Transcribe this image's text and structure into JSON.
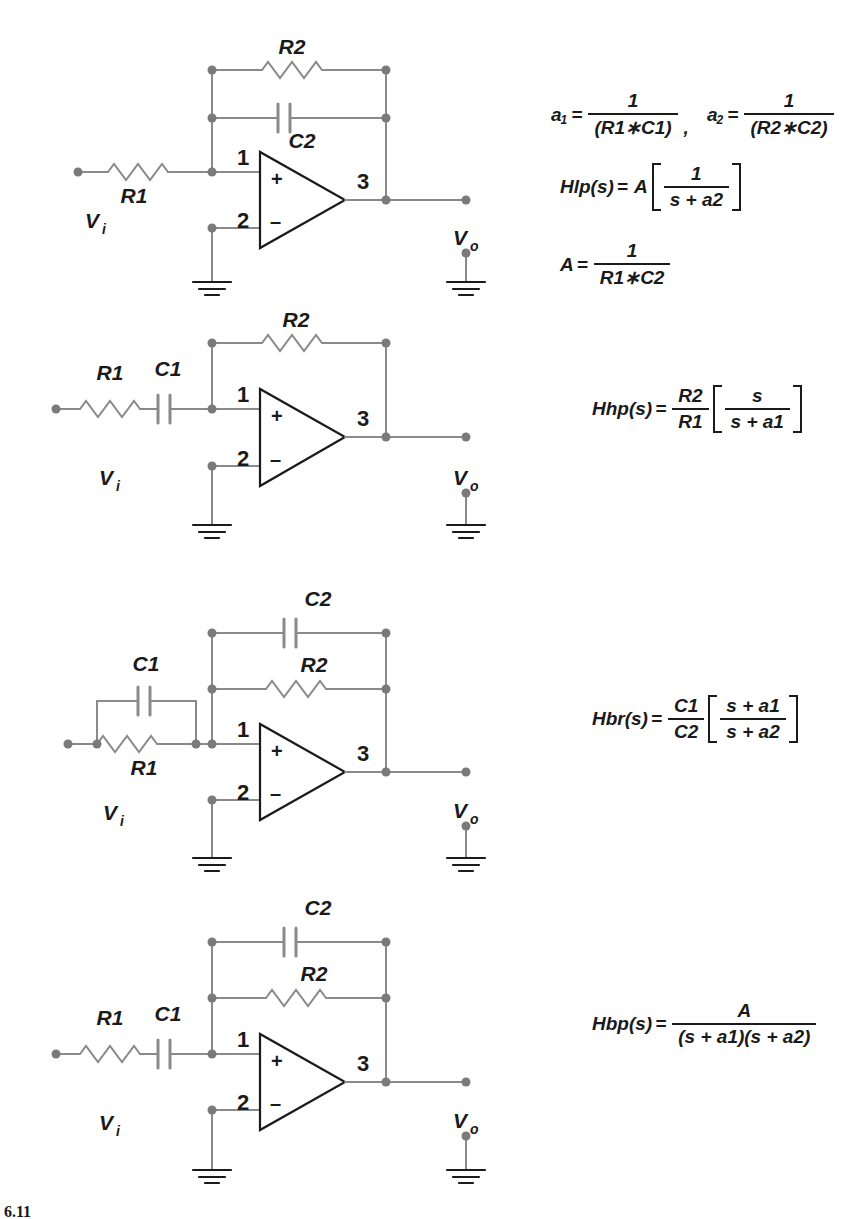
{
  "figure": {
    "caption": "6.11",
    "line_color": "#8a8a8a",
    "node_color": "#7a7a7a",
    "text_color": "#1a1a1a"
  },
  "circuits": [
    {
      "id": "low-pass-filter",
      "name": "Low-pass active filter",
      "input_label": "V",
      "input_sub": "i",
      "output_label": "V",
      "output_sub": "o",
      "pin_plus": "1",
      "pin_minus": "2",
      "pin_out": "3",
      "sign_plus": "+",
      "sign_minus": "–",
      "series_components": [
        {
          "type": "resistor",
          "label": "R1",
          "label_pos": "below"
        }
      ],
      "feedback_components": [
        {
          "type": "resistor",
          "label": "R2",
          "label_pos": "above"
        },
        {
          "type": "capacitor",
          "label": "C2",
          "label_pos": "below"
        }
      ],
      "parallel_input": null
    },
    {
      "id": "high-pass-filter",
      "name": "High-pass active filter",
      "input_label": "V",
      "input_sub": "i",
      "output_label": "V",
      "output_sub": "o",
      "pin_plus": "1",
      "pin_minus": "2",
      "pin_out": "3",
      "sign_plus": "+",
      "sign_minus": "–",
      "series_components": [
        {
          "type": "resistor",
          "label": "R1",
          "label_pos": "above"
        },
        {
          "type": "capacitor",
          "label": "C1",
          "label_pos": "above"
        }
      ],
      "feedback_components": [
        {
          "type": "resistor",
          "label": "R2",
          "label_pos": "above"
        }
      ],
      "parallel_input": null
    },
    {
      "id": "band-reject-filter",
      "name": "Band-reject active filter",
      "input_label": "V",
      "input_sub": "i",
      "output_label": "V",
      "output_sub": "o",
      "pin_plus": "1",
      "pin_minus": "2",
      "pin_out": "3",
      "sign_plus": "+",
      "sign_minus": "–",
      "series_components": [
        {
          "type": "resistor",
          "label": "R1",
          "label_pos": "below"
        }
      ],
      "feedback_components": [
        {
          "type": "capacitor",
          "label": "C2",
          "label_pos": "above"
        },
        {
          "type": "resistor",
          "label": "R2",
          "label_pos": "above"
        }
      ],
      "parallel_input": {
        "type": "capacitor",
        "label": "C1",
        "label_pos": "above"
      }
    },
    {
      "id": "band-pass-filter",
      "name": "Band-pass active filter",
      "input_label": "V",
      "input_sub": "i",
      "output_label": "V",
      "output_sub": "o",
      "pin_plus": "1",
      "pin_minus": "2",
      "pin_out": "3",
      "sign_plus": "+",
      "sign_minus": "–",
      "series_components": [
        {
          "type": "resistor",
          "label": "R1",
          "label_pos": "above"
        },
        {
          "type": "capacitor",
          "label": "C1",
          "label_pos": "above"
        }
      ],
      "feedback_components": [
        {
          "type": "capacitor",
          "label": "C2",
          "label_pos": "above"
        },
        {
          "type": "resistor",
          "label": "R2",
          "label_pos": "above"
        }
      ],
      "parallel_input": null
    }
  ],
  "equations": {
    "a1": {
      "name": "a",
      "sub": "1",
      "eq": "=",
      "num": "1",
      "den": "(R1∗C1)",
      "trail": ","
    },
    "a2": {
      "name": "a",
      "sub": "2",
      "eq": "=",
      "num": "1",
      "den": "(R2∗C2)"
    },
    "hlp": {
      "name": "Hlp(s)",
      "eq": "=",
      "gain": "A",
      "num": "1",
      "den": "s + a2"
    },
    "A": {
      "name": "A",
      "eq": "=",
      "num": "1",
      "den": "R1∗C2"
    },
    "hhp": {
      "name": "Hhp(s)",
      "eq": "=",
      "pre_num": "R2",
      "pre_den": "R1",
      "num": "s",
      "den": "s + a1"
    },
    "hbr": {
      "name": "Hbr(s)",
      "eq": "=",
      "pre_num": "C1",
      "pre_den": "C2",
      "num": "s + a1",
      "den": "s + a2"
    },
    "hbp": {
      "name": "Hbp(s)",
      "eq": "=",
      "num": "A",
      "den": "(s + a1)(s + a2)"
    }
  }
}
